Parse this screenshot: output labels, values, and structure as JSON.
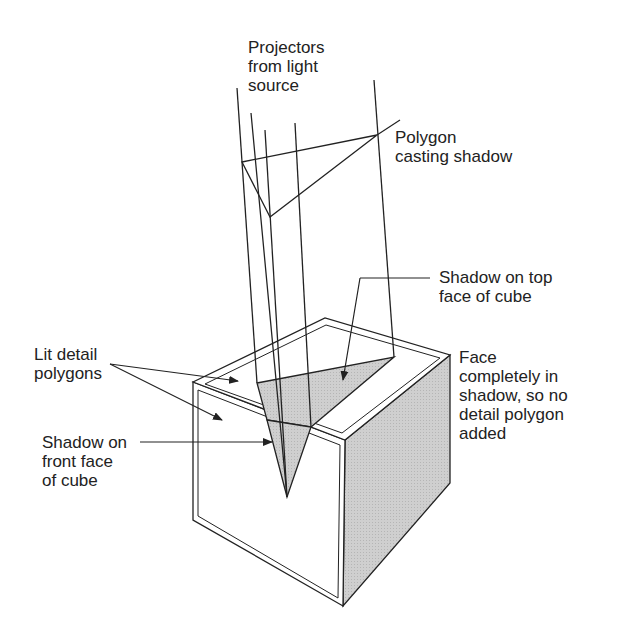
{
  "diagram": {
    "labels": {
      "projectors": [
        "Projectors",
        "from light",
        "source"
      ],
      "polygon": [
        "Polygon",
        "casting shadow"
      ],
      "shadow_top": [
        "Shadow on top",
        "face of cube"
      ],
      "lit_detail": [
        "Lit detail",
        "polygons"
      ],
      "face_shadow": [
        "Face",
        "completely in",
        "shadow, so no",
        "detail polygon",
        "added"
      ],
      "shadow_front": [
        "Shadow on",
        "front face",
        "of cube"
      ]
    },
    "colors": {
      "line": "#222222",
      "shadow_fill": "#c8c8c8",
      "background": "#ffffff"
    }
  }
}
